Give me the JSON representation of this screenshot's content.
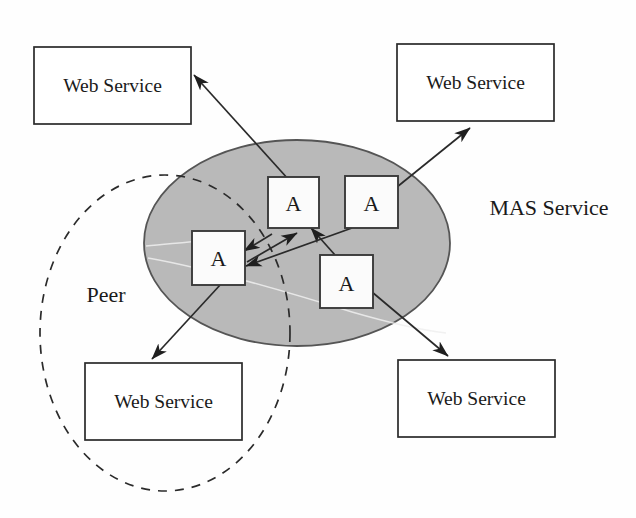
{
  "diagram": {
    "colors": {
      "mas_fill": "#b9b9b9",
      "mas_stroke": "#555555",
      "box_fill": "#ffffff",
      "box_stroke": "#2a2a2a",
      "line": "#2a2a2a",
      "background": "#fefefe"
    },
    "free_labels": [
      {
        "id": "mas-service",
        "text": "MAS Service",
        "x": 549,
        "y": 215
      },
      {
        "id": "peer",
        "text": "Peer",
        "x": 106,
        "y": 302
      }
    ],
    "web_services": [
      {
        "id": "web-service-top-left",
        "text": "Web Service",
        "x": 34,
        "y": 47,
        "w": 157,
        "h": 77
      },
      {
        "id": "web-service-top-right",
        "text": "Web Service",
        "x": 397,
        "y": 44,
        "w": 157,
        "h": 77
      },
      {
        "id": "web-service-bottom-left",
        "text": "Web Service",
        "x": 85,
        "y": 363,
        "w": 157,
        "h": 77
      },
      {
        "id": "web-service-bottom-right",
        "text": "Web Service",
        "x": 398,
        "y": 360,
        "w": 157,
        "h": 77
      }
    ],
    "agents": [
      {
        "id": "agent-left",
        "text": "A",
        "x": 192,
        "y": 231,
        "w": 53,
        "h": 54
      },
      {
        "id": "agent-top-mid",
        "text": "A",
        "x": 268,
        "y": 177,
        "w": 51,
        "h": 51
      },
      {
        "id": "agent-top-right",
        "text": "A",
        "x": 345,
        "y": 176,
        "w": 53,
        "h": 52
      },
      {
        "id": "agent-bottom-mid",
        "text": "A",
        "x": 320,
        "y": 255,
        "w": 53,
        "h": 53
      }
    ],
    "mas_ellipse": {
      "cx": 297,
      "cy": 243,
      "rx": 153,
      "ry": 103
    },
    "peer_ellipse": {
      "cx": 165,
      "cy": 333,
      "rx": 125,
      "ry": 158
    },
    "connections": [
      {
        "id": "conn-agent-topmid-to-ws-topleft",
        "from": "agent-top-mid",
        "to": "web-service-top-left",
        "arrow": "to"
      },
      {
        "id": "conn-agent-topright-to-ws-topright",
        "from": "agent-top-right",
        "to": "web-service-top-right",
        "arrow": "to"
      },
      {
        "id": "conn-agent-left-to-ws-bottomleft",
        "from": "agent-left",
        "to": "web-service-bottom-left",
        "arrow": "to"
      },
      {
        "id": "conn-agent-bottommid-to-ws-bottomright",
        "from": "agent-bottom-mid",
        "to": "web-service-bottom-right",
        "arrow": "to"
      },
      {
        "id": "conn-agent-topmid-to-agent-left",
        "from": "agent-top-mid",
        "to": "agent-left",
        "arrow": "to"
      },
      {
        "id": "conn-agent-bottommid-to-agent-topmid",
        "from": "agent-bottom-mid",
        "to": "agent-top-mid",
        "arrow": "to"
      },
      {
        "id": "conn-agent-topright-to-agent-left",
        "from": "agent-top-right",
        "to": "agent-left",
        "arrow": "to"
      },
      {
        "id": "conn-agent-left-to-agent-topmid",
        "from": "agent-left",
        "to": "agent-top-mid",
        "arrow": "to"
      }
    ]
  }
}
